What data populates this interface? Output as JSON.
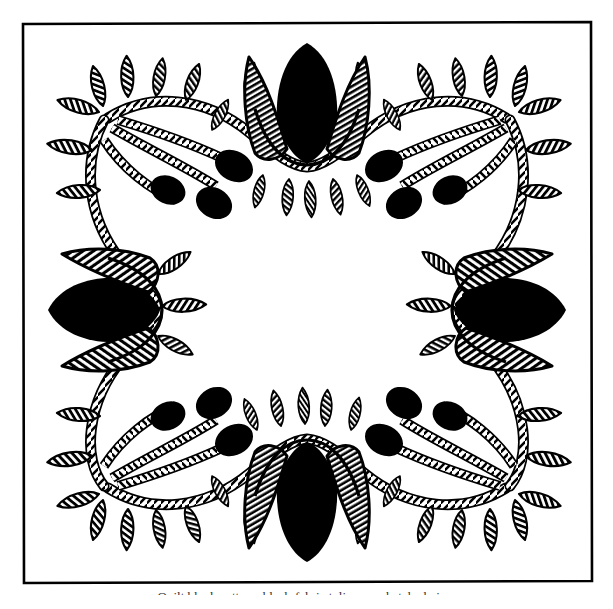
{
  "plate": {
    "title": "Tulip and Vine Wreath Appliqué Block",
    "style": "line-drawing",
    "medium": "pen-and-ink quilt pattern diagram",
    "background_color": "#ffffff",
    "ink_color": "#000000"
  },
  "frame": {
    "name": "outer-border-rule",
    "x": 22,
    "y": 22,
    "width": 570,
    "height": 561,
    "stroke_color": "#000000",
    "stroke_width": 2.5,
    "hand_drawn": true
  },
  "caption": {
    "text": "Quilt block pattern: black-fabric tulips on a hatched vine.",
    "clipped": true,
    "note": "caption is cut off by the bottom edge of the page"
  },
  "motifs": {
    "tulips": [
      {
        "name": "tulip-top",
        "position": "top-center",
        "cx": 307,
        "cy": 105,
        "rotation": 0,
        "black_petal": true,
        "hatched_petals": 2,
        "leaflets_below": 5
      },
      {
        "name": "tulip-right",
        "position": "right-center",
        "cx": 508,
        "cy": 310,
        "rotation": 90,
        "black_petal": true,
        "hatched_petals": 2,
        "leaflets_below": 3
      },
      {
        "name": "tulip-bottom",
        "position": "bottom-center",
        "cx": 307,
        "cy": 500,
        "rotation": 180,
        "black_petal": true,
        "hatched_petals": 2,
        "leaflets_below": 5
      },
      {
        "name": "tulip-left",
        "position": "left-center",
        "cx": 106,
        "cy": 310,
        "rotation": 270,
        "black_petal": true,
        "hatched_petals": 2,
        "leaflets_below": 3
      }
    ],
    "corner_clusters": [
      {
        "name": "cluster-top-left",
        "corner": "top-left",
        "buds": 3,
        "leaves": 7,
        "bud_fill": "solid-black"
      },
      {
        "name": "cluster-top-right",
        "corner": "top-right",
        "buds": 3,
        "leaves": 7,
        "bud_fill": "solid-black"
      },
      {
        "name": "cluster-bottom-left",
        "corner": "bottom-left",
        "buds": 3,
        "leaves": 7,
        "bud_fill": "solid-black"
      },
      {
        "name": "cluster-bottom-right",
        "corner": "bottom-right",
        "buds": 3,
        "leaves": 7,
        "bud_fill": "solid-black"
      }
    ],
    "vine": {
      "name": "rope-vine-swag",
      "texture": "twisted-rope-hatched",
      "swags": 4,
      "stroke_color": "#000000",
      "description": "Continuous hatched rope vine looping in four swags between the tulips, bowing inward at each side."
    },
    "leaf": {
      "fill": "diagonal-hatch",
      "outline": "#000000",
      "total_count": 44
    },
    "bud": {
      "fill": "#000000",
      "shape": "teardrop",
      "total_count": 12
    }
  },
  "counts": {
    "tulips": 4,
    "buds": 12,
    "leaves": 44,
    "swags": 4
  }
}
